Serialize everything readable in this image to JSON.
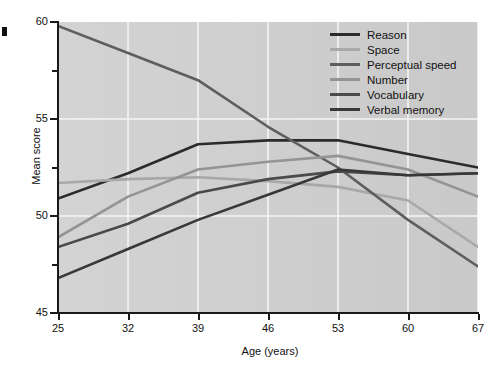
{
  "chart_data": {
    "type": "line",
    "title": "",
    "xlabel": "Age (years)",
    "ylabel": "Mean score",
    "x": [
      25,
      32,
      39,
      46,
      53,
      60,
      67
    ],
    "xticklabels": [
      "25",
      "32",
      "39",
      "46",
      "53",
      "60",
      "67"
    ],
    "yticklabels": [
      "45",
      "50",
      "55",
      "60"
    ],
    "yticks": [
      45,
      50,
      55,
      60
    ],
    "yminorticks": [
      47.5,
      52.5,
      57.5
    ],
    "xlim": [
      25,
      67
    ],
    "ylim": [
      45,
      60
    ],
    "grid": true,
    "legend_position": "top-right",
    "series": [
      {
        "name": "Reason",
        "color": "#2b2b2b",
        "values": [
          50.9,
          52.2,
          53.7,
          53.9,
          53.9,
          53.2,
          52.5
        ]
      },
      {
        "name": "Space",
        "color": "#a8a8a8",
        "values": [
          51.7,
          51.9,
          52.0,
          51.8,
          51.5,
          50.8,
          48.4
        ]
      },
      {
        "name": "Perceptual speed",
        "color": "#5e5e5e",
        "values": [
          59.8,
          58.4,
          57.0,
          54.6,
          52.5,
          49.8,
          47.4
        ]
      },
      {
        "name": "Number",
        "color": "#949494",
        "values": [
          48.9,
          51.0,
          52.4,
          52.8,
          53.1,
          52.4,
          51.0
        ]
      },
      {
        "name": "Vocabulary",
        "color": "#4a4a4a",
        "values": [
          48.4,
          49.6,
          51.2,
          51.9,
          52.3,
          52.1,
          52.2
        ]
      },
      {
        "name": "Verbal memory",
        "color": "#383838",
        "values": [
          46.8,
          48.3,
          49.8,
          51.1,
          52.4,
          52.1,
          52.2
        ]
      }
    ]
  },
  "legend": {
    "items": [
      {
        "label": "Reason"
      },
      {
        "label": "Space"
      },
      {
        "label": "Perceptual speed"
      },
      {
        "label": "Number"
      },
      {
        "label": "Vocabulary"
      },
      {
        "label": "Verbal memory"
      }
    ]
  },
  "colors": {
    "plot_background": "#d0d0d0",
    "gridline": "#f4f4f4",
    "axis": "#1a1a1a",
    "text": "#111111"
  }
}
